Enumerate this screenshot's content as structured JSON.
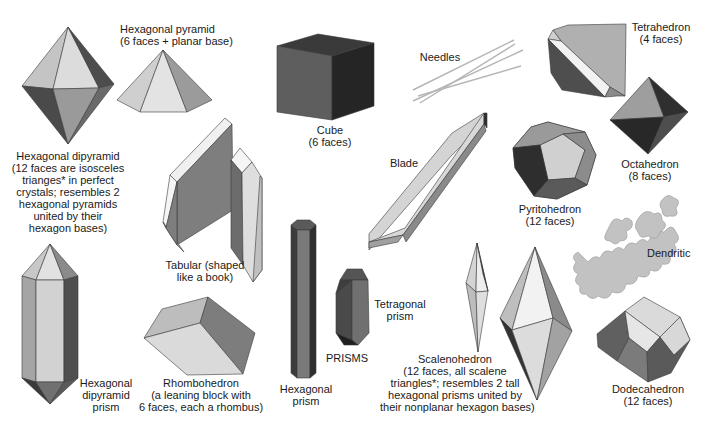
{
  "diagram": {
    "colors": {
      "background": "#ffffff",
      "face_light": "#d9d9d9",
      "face_mid": "#a6a6a6",
      "face_dark": "#5a5a5a",
      "face_darkest": "#2e2e2e",
      "edge_white": "#f2f2f2",
      "needle": "#b8b8b8",
      "text": "#1a1a1a"
    },
    "forms": [
      {
        "id": "hexagonal-dipyramid",
        "label": [
          "Hexagonal dipyramid",
          "(12 faces are isosceles",
          "trianges* in perfect",
          "crystals; resembles 2",
          "hexagonal pyramids",
          "united by their",
          "hexagon bases)"
        ]
      },
      {
        "id": "hexagonal-pyramid",
        "label": [
          "Hexagonal pyramid",
          "(6 faces + planar base)"
        ]
      },
      {
        "id": "tabular",
        "label": [
          "Tabular (shaped",
          "like a book)"
        ]
      },
      {
        "id": "cube",
        "label": [
          "Cube",
          "(6 faces)"
        ]
      },
      {
        "id": "needles",
        "label": [
          "Needles"
        ]
      },
      {
        "id": "tetrahedron",
        "label": [
          "Tetrahedron",
          "(4 faces)"
        ]
      },
      {
        "id": "octahedron",
        "label": [
          "Octahedron",
          "(8 faces)"
        ]
      },
      {
        "id": "blade",
        "label": [
          "Blade"
        ]
      },
      {
        "id": "pyritohedron",
        "label": [
          "Pyritohedron",
          "(12 faces)"
        ]
      },
      {
        "id": "dendritic",
        "label": [
          "Dendritic"
        ]
      },
      {
        "id": "hexagonal-dipyramid-prism",
        "label": [
          "Hexagonal",
          "dipyramid",
          "prism"
        ]
      },
      {
        "id": "rhombohedron",
        "label": [
          "Rhombohedron",
          "(a leaning block with",
          "6 faces, each a rhombus)"
        ]
      },
      {
        "id": "hexagonal-prism",
        "label": [
          "Hexagonal",
          "prism"
        ]
      },
      {
        "id": "prisms-group",
        "label": [
          "PRISMS"
        ]
      },
      {
        "id": "tetragonal-prism",
        "label": [
          "Tetragonal",
          "prism"
        ]
      },
      {
        "id": "scalenohedron",
        "label": [
          "Scalenohedron",
          "(12 faces, all scalene",
          "triangles*; resembles 2 tall",
          "hexagonal prisms united by",
          "their nonplanar hexagon bases)"
        ]
      },
      {
        "id": "dodecahedron",
        "label": [
          "Dodecahedron",
          "(12 faces)"
        ]
      }
    ]
  }
}
